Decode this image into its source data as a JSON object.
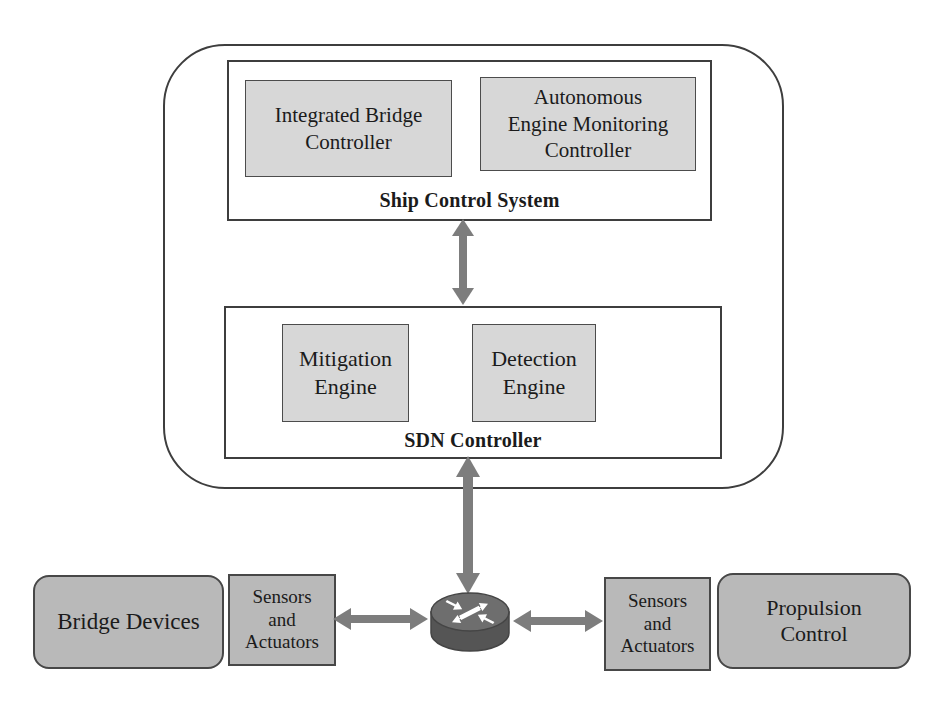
{
  "figure": {
    "colors": {
      "background": "#ffffff",
      "module_fill": "#d7d7d7",
      "field_box_fill": "#b9b9b9",
      "border_dark": "#3e3e3e",
      "arrow_gray": "#7d7d7d",
      "router_top": "#6e6e6e",
      "router_body": "#555555",
      "text": "#1b1b1b"
    },
    "ship_control_system": {
      "label": "Ship Control System",
      "modules": [
        {
          "label": "Integrated Bridge Controller",
          "lines": [
            "Integrated Bridge",
            "Controller"
          ]
        },
        {
          "label": "Autonomous Engine Monitoring Controller",
          "lines": [
            "Autonomous",
            "Engine Monitoring",
            "Controller"
          ]
        }
      ]
    },
    "sdn_controller": {
      "label": "SDN Controller",
      "modules": [
        {
          "label": "Mitigation Engine",
          "lines": [
            "Mitigation",
            "Engine"
          ]
        },
        {
          "label": "Detection Engine",
          "lines": [
            "Detection",
            "Engine"
          ]
        }
      ]
    },
    "field_layer": {
      "bridge_devices": {
        "label": "Bridge Devices"
      },
      "sensors_actuators_left": {
        "label": "Sensors and Actuators",
        "lines": [
          "Sensors",
          "and",
          "Actuators"
        ]
      },
      "router": {
        "icon": "router-icon"
      },
      "sensors_actuators_right": {
        "label": "Sensors and Actuators",
        "lines": [
          "Sensors",
          "and",
          "Actuators"
        ]
      },
      "propulsion_control": {
        "label": "Propulsion Control",
        "lines": [
          "Propulsion",
          "Control"
        ]
      }
    },
    "connections": [
      {
        "from": "Ship Control System",
        "to": "SDN Controller",
        "type": "bidirectional"
      },
      {
        "from": "SDN Controller",
        "to": "router",
        "type": "bidirectional"
      },
      {
        "from": "Sensors and Actuators (left)",
        "to": "router",
        "type": "bidirectional"
      },
      {
        "from": "router",
        "to": "Sensors and Actuators (right)",
        "type": "bidirectional"
      }
    ]
  }
}
